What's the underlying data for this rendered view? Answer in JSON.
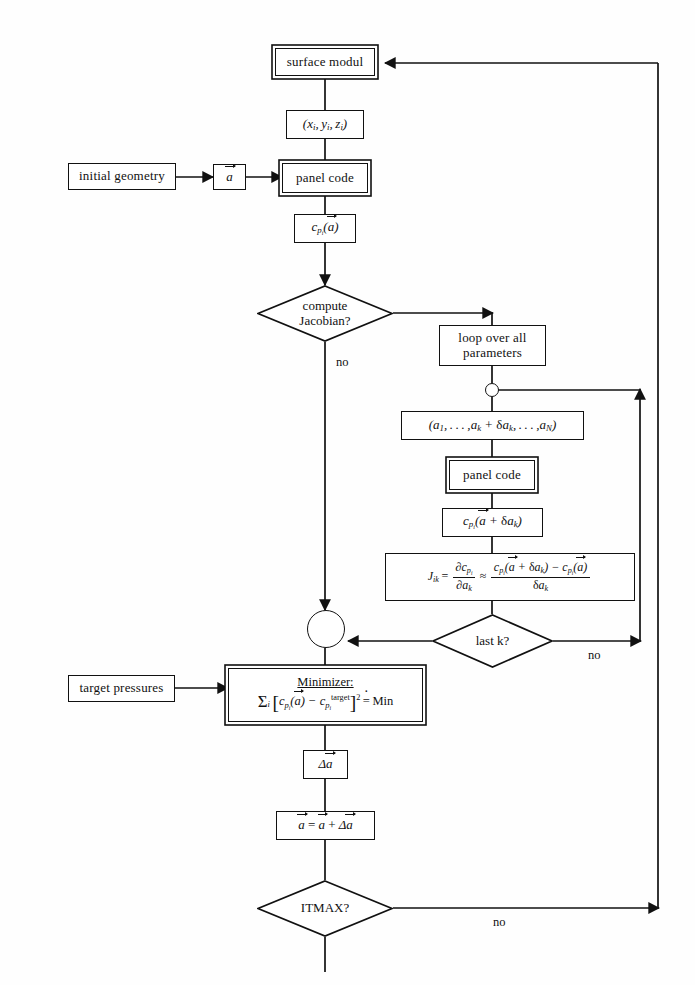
{
  "diagram": {
    "type": "flowchart",
    "background_color": "#fefefe",
    "line_color": "#111111"
  },
  "nodes": {
    "surface_modul": {
      "label": "surface modul",
      "shape": "double-box"
    },
    "coords": {
      "label_html": "(<i>x<sub>i</sub></i>, <i>y<sub>i</sub></i>, <i>z<sub>i</sub></i>)",
      "shape": "box"
    },
    "initial_geometry": {
      "label": "initial geometry",
      "shape": "box"
    },
    "a_vector": {
      "label_html": "<span class=\"vec\">a</span>",
      "shape": "box"
    },
    "panel_code_1": {
      "label": "panel code",
      "shape": "double-box"
    },
    "cp_a": {
      "label_html": "<i>c<sub>p<sub>i</sub></sub></i>(<span class=\"vec\">a</span>)",
      "shape": "box"
    },
    "compute_jacobian": {
      "line1": "compute",
      "line2": "Jacobian?",
      "shape": "diamond"
    },
    "loop_over_params": {
      "line1": "loop over all",
      "line2": "parameters",
      "shape": "box"
    },
    "param_vector": {
      "label_html": "(<i>a</i><sub>1</sub>,…, <i>a<sub>k</sub></i> + <span class=\"up\">δ</span><i>a<sub>k</sub></i>,…, <i>a<sub>N</sub></i>)",
      "shape": "box"
    },
    "panel_code_2": {
      "label": "panel code",
      "shape": "double-box"
    },
    "cp_a_da": {
      "label_html": "<i>c<sub>p<sub>i</sub></sub></i>(<span class=\"vec\">a</span> + <span class=\"up\">δ</span><i>a<sub>k</sub></i>)",
      "shape": "box"
    },
    "jacobian_formula": {
      "shape": "box"
    },
    "last_k": {
      "line1": "last k?",
      "shape": "diamond"
    },
    "target_pressures": {
      "label": "target pressures",
      "shape": "box"
    },
    "minimizer": {
      "title": "Minimizer:",
      "shape": "double-box"
    },
    "delta_a": {
      "label_html": "Δ<span class=\"vec\">a</span>",
      "shape": "box"
    },
    "update_a": {
      "label_html": "<span class=\"vec\">a</span> = <span class=\"vec\">a</span> + Δ<span class=\"vec\">a</span>",
      "shape": "box"
    },
    "itmax": {
      "line1": "ITMAX?",
      "shape": "diamond"
    },
    "junction_loop": {
      "shape": "small-circle"
    },
    "junction_merge": {
      "shape": "circle"
    }
  },
  "edge_labels": {
    "jacobian_no": "no",
    "last_k_no": "no",
    "itmax_no": "no"
  },
  "formulas": {
    "jacobian": {
      "lhs": "J",
      "lhs_sub": "ik",
      "eq": "=",
      "partial_num": "∂c",
      "partial_num_sub": "p",
      "partial_num_sub2": "i",
      "partial_den": "∂a",
      "partial_den_sub": "k",
      "approx": "≈",
      "quot_num": "c_{p_i}(a⃗ + δa_k) − c_{p_i}(a⃗)",
      "quot_den": "δa_k"
    },
    "minimizer": {
      "title": "Minimizer:",
      "expr": "Σ_i [ c_{p_i}(a⃗) − c_{p_i}^{target} ]² ≐ Min",
      "superscript_target": "target",
      "power": "2",
      "rhs": "Min"
    }
  }
}
